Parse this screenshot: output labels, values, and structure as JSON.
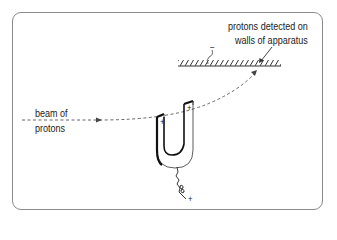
{
  "diagram": {
    "labels": {
      "beam_line1": "beam of",
      "beam_line2": "protons",
      "detected_line1": "protons detected on",
      "detected_line2": "walls of apparatus",
      "plate_charge": "–",
      "magnet_pole_left": "+",
      "magnet_pole_right": "+",
      "wire_charge": "+"
    },
    "colors": {
      "line": "#222222",
      "frame": "#8a8a8a",
      "beam": "#555555",
      "background": "#ffffff"
    }
  }
}
